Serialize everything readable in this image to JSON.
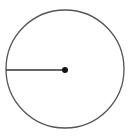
{
  "diagram": {
    "type": "circle-with-radius",
    "colors": {
      "circle_stroke": "#555555",
      "radius_stroke": "#333333",
      "center_fill": "#111111",
      "background": "#ffffff"
    },
    "elements": [
      {
        "name": "circle",
        "label": ""
      },
      {
        "name": "radius",
        "direction": "left",
        "label": ""
      },
      {
        "name": "center-point",
        "label": ""
      }
    ]
  }
}
